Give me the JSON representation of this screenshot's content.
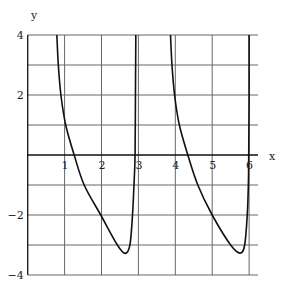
{
  "chart_data": {
    "type": "line",
    "title": "",
    "xlabel": "x",
    "ylabel": "y",
    "xlim": [
      0,
      6.25
    ],
    "ylim": [
      -4,
      4
    ],
    "grid": true,
    "x_ticks": [
      1,
      2,
      3,
      4,
      5,
      6
    ],
    "x_tick_labels": [
      "1",
      "2",
      "3",
      "4",
      "5",
      "6"
    ],
    "y_ticks": [
      -4,
      -3,
      -2,
      -1,
      0,
      1,
      2,
      3,
      4
    ],
    "y_tick_labels": [
      {
        "value": 4,
        "label": "4"
      },
      {
        "value": 2,
        "label": "2"
      },
      {
        "value": -2,
        "label": "−2"
      },
      {
        "value": -4,
        "label": "−4"
      }
    ],
    "vertical_asymptotes": [
      2.93,
      6.0
    ],
    "series": [
      {
        "name": "branch-1",
        "points": [
          [
            0.79,
            4
          ],
          [
            0.83,
            3
          ],
          [
            0.9,
            2
          ],
          [
            1.03,
            1
          ],
          [
            1.26,
            0
          ],
          [
            1.53,
            -1
          ],
          [
            1.98,
            -2
          ],
          [
            2.43,
            -3
          ],
          [
            2.64,
            -3.28
          ],
          [
            2.77,
            -3
          ],
          [
            2.84,
            -2
          ],
          [
            2.88,
            -1
          ],
          [
            2.91,
            0
          ],
          [
            2.92,
            2
          ],
          [
            2.93,
            4
          ]
        ]
      },
      {
        "name": "branch-2",
        "points": [
          [
            3.87,
            4
          ],
          [
            3.91,
            3
          ],
          [
            3.98,
            2
          ],
          [
            4.11,
            1
          ],
          [
            4.34,
            0
          ],
          [
            4.61,
            -1
          ],
          [
            5.0,
            -2
          ],
          [
            5.5,
            -3
          ],
          [
            5.76,
            -3.27
          ],
          [
            5.88,
            -3
          ],
          [
            5.95,
            -2
          ],
          [
            5.98,
            -1
          ],
          [
            5.99,
            0
          ],
          [
            6.0,
            2
          ],
          [
            6.0,
            4
          ]
        ]
      }
    ]
  }
}
